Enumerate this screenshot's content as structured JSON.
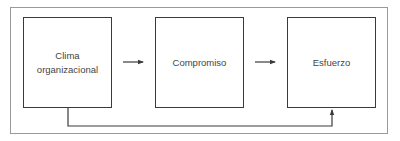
{
  "diagram": {
    "type": "flow",
    "nodes": [
      {
        "id": "clima",
        "label": "Clima\norganizacional"
      },
      {
        "id": "compromiso",
        "label": "Compromiso"
      },
      {
        "id": "esfuerzo",
        "label": "Esfuerzo"
      }
    ],
    "edges": [
      {
        "from": "clima",
        "to": "compromiso"
      },
      {
        "from": "compromiso",
        "to": "esfuerzo"
      },
      {
        "from": "clima",
        "to": "esfuerzo",
        "route": "below"
      }
    ],
    "colors": {
      "stroke": "#3a3a3a",
      "frame": "#9a9a9a",
      "text": "#444444"
    }
  }
}
